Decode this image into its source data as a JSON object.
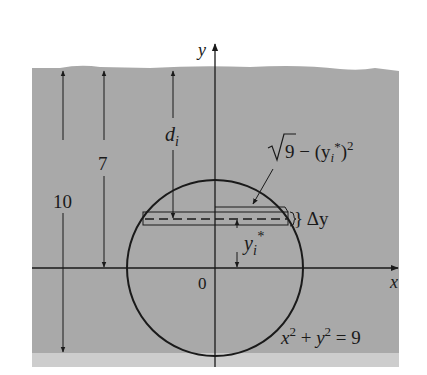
{
  "figure": {
    "colors": {
      "water": "#a9a9a9",
      "water_bottom_band": "#cdcdcd",
      "background": "#ffffff",
      "ink": "#1a1a1a"
    },
    "axes": {
      "x_label": "x",
      "y_label": "y",
      "origin_label": "0"
    },
    "dimensions": {
      "total_depth_label": "10",
      "center_depth_label": "7",
      "strip_depth_label": "d",
      "strip_depth_subscript": "i"
    },
    "strip": {
      "half_width_label_root": "9 − (y",
      "half_width_label_sub": "i",
      "half_width_label_sup_star": "*",
      "half_width_label_close": ")",
      "half_width_label_exp": "2",
      "thickness_label": "} Δy",
      "height_label": "y",
      "height_label_sub": "i",
      "height_label_star": "*"
    },
    "equation": {
      "x_term": "x",
      "exp1": "2",
      "plus": " + ",
      "y_term": "y",
      "exp2": "2",
      "equals": " = 9"
    }
  }
}
